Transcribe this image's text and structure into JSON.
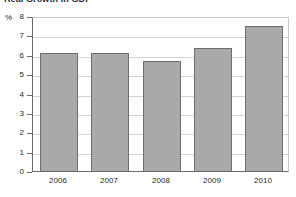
{
  "chart_data": {
    "type": "bar",
    "title": "Real Growth in GDP",
    "xlabel": "",
    "ylabel": "%",
    "unit_label": "%",
    "categories": [
      "2006",
      "2007",
      "2008",
      "2009",
      "2010"
    ],
    "values": [
      6.2,
      6.2,
      5.8,
      6.45,
      7.6
    ],
    "series": [
      {
        "name": "Real Growth in GDP",
        "values": [
          6.2,
          6.2,
          5.8,
          6.45,
          7.6
        ]
      }
    ],
    "ylim": [
      0,
      8
    ],
    "ytick_values": [
      0,
      1,
      2,
      3,
      4,
      5,
      6,
      7,
      8
    ],
    "ytick_labels": [
      "0",
      "1",
      "2",
      "3",
      "4",
      "5",
      "6",
      "7",
      "8"
    ],
    "grid": true,
    "grid_axis": "y",
    "legend": false,
    "legend_position": "none",
    "colors": {
      "bar_fill": "#a9a9a9",
      "bar_border": "#6e6e6e",
      "gridline": "#d2d2d2",
      "axis": "#6b6b6b",
      "plot_border": "#c9c9c9",
      "text": "#231f20",
      "background": "#ffffff"
    }
  }
}
